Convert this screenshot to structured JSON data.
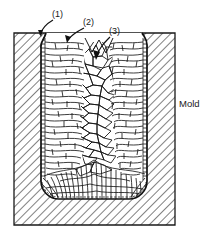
{
  "figure": {
    "labels": {
      "callout_1": "(1)",
      "callout_2": "(2)",
      "callout_3": "(3)",
      "mold": "Mold"
    },
    "zones": {
      "chill": "(1)",
      "columnar": "(2)",
      "equiaxed": "(3)"
    },
    "colors": {
      "ink": "#1a1a1a",
      "line": "#000000",
      "hatch": "#4d4d4d",
      "background": "#ffffff",
      "cavity_fill": "#ffffff"
    },
    "geometry": {
      "mold_left": 14,
      "mold_right": 175,
      "mold_top": 33,
      "mold_bottom": 225,
      "cavity_left": 41,
      "cavity_right": 147,
      "cavity_top": 36,
      "cavity_bottom": 199,
      "corner_radius": 18
    }
  }
}
